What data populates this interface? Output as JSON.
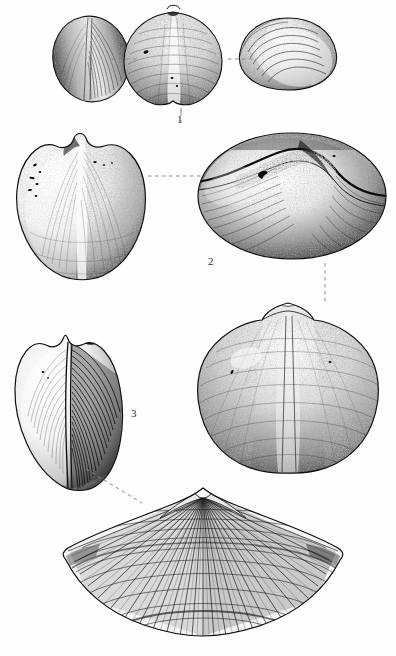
{
  "plate": {
    "title": "Brachiopod specimen plate",
    "background_color": "#ffffff",
    "ink_color": "#1a1a1a",
    "label_color": "#2b2b2b",
    "width": 396,
    "height": 656,
    "medium": "stipple ink illustration"
  },
  "figures": [
    {
      "id": "figure-1",
      "label": "1",
      "label_x": 180,
      "label_y": 120,
      "views": [
        {
          "name": "lateral-view",
          "cx": 91,
          "cy": 59,
          "rx": 38,
          "ry": 43,
          "rot": -12
        },
        {
          "name": "ventral-view",
          "cx": 173,
          "cy": 58,
          "rx": 48,
          "ry": 47,
          "rot": 0
        },
        {
          "name": "anterior-view",
          "cx": 288,
          "cy": 54,
          "rx": 48,
          "ry": 32,
          "rot": 0
        }
      ]
    },
    {
      "id": "figure-2",
      "label": "2",
      "label_x": 211,
      "label_y": 262,
      "views": [
        {
          "name": "dorsal-view",
          "cx": 81,
          "cy": 206,
          "rx": 64,
          "ry": 71,
          "rot": 0
        },
        {
          "name": "anterior-view",
          "cx": 292,
          "cy": 196,
          "rx": 94,
          "ry": 63,
          "rot": 0
        }
      ]
    },
    {
      "id": "figure-3",
      "label": "3",
      "label_x": 134,
      "label_y": 414,
      "views": [
        {
          "name": "lateral-view",
          "cx": 70,
          "cy": 412,
          "rx": 50,
          "ry": 76,
          "rot": 0
        },
        {
          "name": "ventral-view",
          "cx": 288,
          "cy": 385,
          "rx": 88,
          "ry": 82,
          "rot": 0
        },
        {
          "name": "fan-view",
          "cx": 203,
          "cy": 555,
          "rx": 137,
          "ry": 75,
          "rot": 0
        }
      ]
    }
  ],
  "connectors": [
    {
      "name": "connector-1a",
      "x1": 112,
      "y1": 59,
      "x2": 140,
      "y2": 59
    },
    {
      "name": "connector-1b",
      "x1": 228,
      "y1": 59,
      "x2": 256,
      "y2": 59
    },
    {
      "name": "connector-1c",
      "x1": 181,
      "y1": 108,
      "x2": 181,
      "y2": 122
    },
    {
      "name": "connector-2a",
      "x1": 148,
      "y1": 176,
      "x2": 203,
      "y2": 176
    },
    {
      "name": "connector-3a",
      "x1": 325,
      "y1": 263,
      "x2": 325,
      "y2": 302
    },
    {
      "name": "connector-3b",
      "x1": 86,
      "y1": 469,
      "x2": 142,
      "y2": 503
    }
  ]
}
